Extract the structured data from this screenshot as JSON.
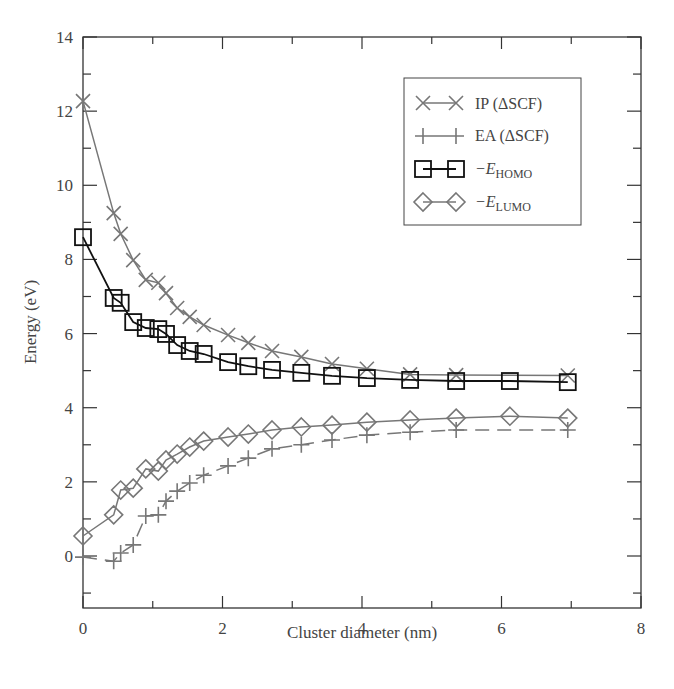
{
  "chart_data": {
    "type": "line",
    "title": "",
    "xlabel": "Cluster diameter (nm)",
    "ylabel": "Energy (eV)",
    "xlim": [
      0,
      8
    ],
    "ylim": [
      -1.4,
      14
    ],
    "xticks": [
      0,
      2,
      4,
      6,
      8
    ],
    "yticks": [
      0,
      2,
      4,
      6,
      8,
      10,
      12,
      14
    ],
    "grid": false,
    "legend_position": "upper right",
    "series": [
      {
        "name": "IP (ΔSCF)",
        "marker": "x",
        "line": "solid",
        "color": "#777777",
        "x": [
          0,
          0.44,
          0.54,
          0.72,
          0.9,
          1.08,
          1.19,
          1.35,
          1.53,
          1.73,
          2.08,
          2.37,
          2.71,
          3.13,
          3.57,
          4.07,
          4.69,
          5.35,
          6.95
        ],
        "y": [
          12.27,
          9.25,
          8.69,
          7.98,
          7.45,
          7.37,
          7.09,
          6.69,
          6.45,
          6.23,
          5.96,
          5.75,
          5.53,
          5.37,
          5.18,
          5.05,
          4.9,
          4.88,
          4.87
        ]
      },
      {
        "name": "EA (ΔSCF)",
        "marker": "+",
        "line": "dashed",
        "color": "#777777",
        "x": [
          0,
          0.44,
          0.54,
          0.72,
          0.9,
          1.08,
          1.19,
          1.35,
          1.53,
          1.73,
          2.08,
          2.37,
          2.71,
          3.13,
          3.57,
          4.07,
          4.69,
          5.35,
          6.95
        ],
        "y": [
          -0.03,
          -0.14,
          0.08,
          0.3,
          1.08,
          1.11,
          1.48,
          1.75,
          1.97,
          2.18,
          2.43,
          2.64,
          2.89,
          3.0,
          3.13,
          3.26,
          3.34,
          3.4,
          3.4
        ]
      },
      {
        "name": "−E_HOMO",
        "marker": "square",
        "line": "solid",
        "color": "#111111",
        "x": [
          0,
          0.44,
          0.54,
          0.72,
          0.9,
          1.08,
          1.19,
          1.35,
          1.53,
          1.73,
          2.08,
          2.37,
          2.71,
          3.13,
          3.57,
          4.07,
          4.69,
          5.35,
          6.12,
          6.95
        ],
        "y": [
          8.6,
          6.96,
          6.83,
          6.31,
          6.15,
          6.12,
          5.99,
          5.69,
          5.53,
          5.45,
          5.23,
          5.12,
          5.02,
          4.94,
          4.86,
          4.8,
          4.75,
          4.72,
          4.72,
          4.69
        ]
      },
      {
        "name": "−E_LUMO",
        "marker": "diamond",
        "line": "solid",
        "color": "#777777",
        "x": [
          0,
          0.44,
          0.54,
          0.72,
          0.9,
          1.08,
          1.19,
          1.35,
          1.53,
          1.73,
          2.08,
          2.37,
          2.71,
          3.13,
          3.57,
          4.07,
          4.69,
          5.35,
          6.12,
          6.95
        ],
        "y": [
          0.54,
          1.11,
          1.78,
          1.83,
          2.35,
          2.29,
          2.59,
          2.75,
          2.94,
          3.1,
          3.21,
          3.29,
          3.4,
          3.48,
          3.53,
          3.61,
          3.67,
          3.72,
          3.77,
          3.72
        ]
      }
    ]
  },
  "legend": {
    "items": [
      {
        "label": "IP (ΔSCF)",
        "prefix": "",
        "sub": ""
      },
      {
        "label": "EA (ΔSCF)",
        "prefix": "",
        "sub": ""
      },
      {
        "label": "",
        "prefix": "−E",
        "sub": "HOMO"
      },
      {
        "label": "",
        "prefix": "−E",
        "sub": "LUMO"
      }
    ]
  },
  "axes": {
    "x_label": "Cluster diameter (nm)",
    "y_label": "Energy (eV)",
    "x_tick_labels": [
      "0",
      "2",
      "4",
      "6",
      "8"
    ],
    "y_tick_labels": [
      "0",
      "2",
      "4",
      "6",
      "8",
      "10",
      "12",
      "14"
    ]
  }
}
